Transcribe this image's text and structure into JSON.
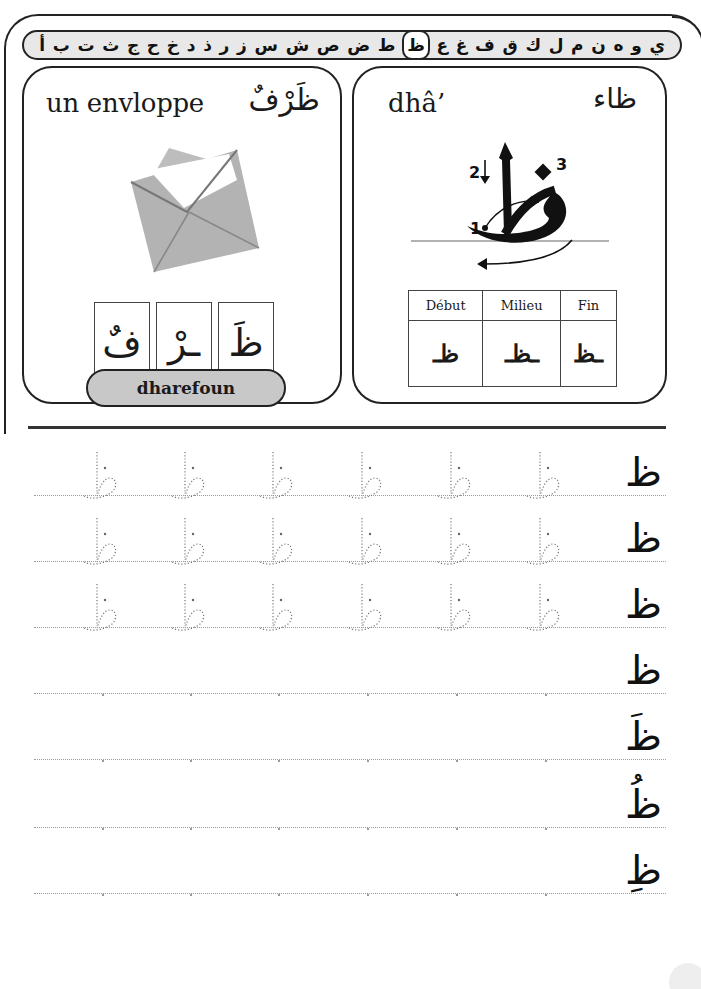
{
  "alphabet": {
    "letters": [
      "أ",
      "ب",
      "ت",
      "ث",
      "ج",
      "ح",
      "خ",
      "د",
      "ذ",
      "ر",
      "ز",
      "س",
      "ش",
      "ص",
      "ض",
      "ط",
      "ظ",
      "ع",
      "غ",
      "ف",
      "ق",
      "ك",
      "ل",
      "م",
      "ن",
      "ه",
      "و",
      "ي"
    ],
    "active_index": 16,
    "active_letter": "ظ"
  },
  "word_card": {
    "french": "un envlopppe",
    "french_display": "un envloppe",
    "arabic": "ظَرْفٌ",
    "image": "envelope-illustration",
    "syllables": [
      "ظَ",
      "ـرْ",
      "فٌ"
    ],
    "transliteration": "dharefoun"
  },
  "letter_card": {
    "name_fr": "dhâ’",
    "name_ar": "ظاء",
    "stroke_labels": [
      "1",
      "2",
      "3"
    ],
    "forms_table": {
      "headers": [
        "Début",
        "Milieu",
        "Fin"
      ],
      "forms": [
        "ظـ",
        "ـظـ",
        "ـظ"
      ]
    }
  },
  "practice": {
    "rows": [
      {
        "model": "ظ",
        "traces": 6
      },
      {
        "model": "ظ",
        "traces": 6
      },
      {
        "model": "ظ",
        "traces": 6
      },
      {
        "model": "ظ",
        "traces": 0
      },
      {
        "model": "ظَ",
        "traces": 0
      },
      {
        "model": "ظُ",
        "traces": 0
      },
      {
        "model": "ظِ",
        "traces": 0
      }
    ]
  },
  "colors": {
    "ink": "#1a1a1a",
    "bar_fill": "#e8e8e8",
    "pill_fill": "#c8c8c8",
    "envelope_gray": "#b3b3b3",
    "guide_dots": "#9a9a9a"
  }
}
